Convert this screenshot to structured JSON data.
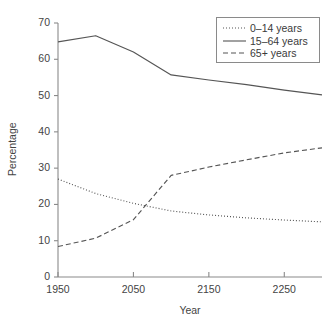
{
  "chart_data": {
    "type": "line",
    "title": "",
    "xlabel": "Year",
    "ylabel": "Percentage",
    "xlim": [
      1950,
      2300
    ],
    "ylim": [
      0,
      70
    ],
    "xticks": [
      "1950",
      "2050",
      "2150",
      "2250"
    ],
    "xtick_values": [
      1950,
      2050,
      2150,
      2250
    ],
    "yticks": [
      "0",
      "10",
      "20",
      "30",
      "40",
      "50",
      "60",
      "70"
    ],
    "ytick_values": [
      0,
      10,
      20,
      30,
      40,
      50,
      60,
      70
    ],
    "grid": false,
    "legend_position": "top-right",
    "x": [
      1950,
      2000,
      2050,
      2100,
      2150,
      2200,
      2250,
      2300
    ],
    "series": [
      {
        "name": "0–14 years",
        "style": "dotted",
        "color": "#555555",
        "values": [
          27.0,
          23.0,
          20.3,
          18.2,
          17.1,
          16.3,
          15.7,
          15.2
        ]
      },
      {
        "name": "15–64 years",
        "style": "solid",
        "color": "#555555",
        "values": [
          64.8,
          66.5,
          62.0,
          55.7,
          54.3,
          53.0,
          51.5,
          50.2
        ]
      },
      {
        "name": "65+ years",
        "style": "dashed",
        "color": "#555555",
        "values": [
          8.4,
          10.7,
          15.8,
          28.0,
          30.3,
          32.3,
          34.2,
          35.6
        ]
      }
    ]
  },
  "axis": {
    "ylabel": "Percentage",
    "xlabel": "Year",
    "yticks": [
      "70",
      "60",
      "50",
      "40",
      "30",
      "20",
      "10",
      "0"
    ],
    "xticks": [
      "1950",
      "2050",
      "2150",
      "2250"
    ]
  },
  "legend": {
    "items": [
      {
        "label": "0–14 years",
        "style": "dotted"
      },
      {
        "label": "15–64 years",
        "style": "solid"
      },
      {
        "label": "65+ years",
        "style": "dashed"
      }
    ]
  },
  "colors": {
    "line": "#555555",
    "axis": "#8a8a8a",
    "text": "#3a3a3a"
  }
}
